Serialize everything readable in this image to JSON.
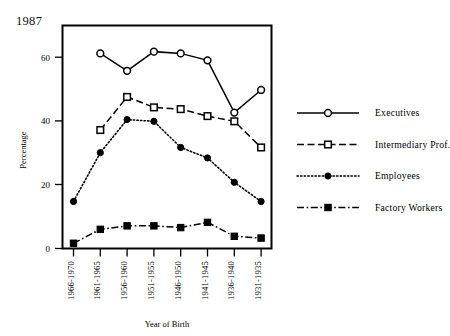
{
  "chart_data": {
    "type": "line",
    "title": "1987",
    "xlabel": "Year of Birth",
    "ylabel": "Percentage",
    "categories": [
      "1966-1970",
      "1961-1965",
      "1956-1960",
      "1951-1955",
      "1946-1950",
      "1941-1945",
      "1936-1940",
      "1931-1935"
    ],
    "ylim": [
      0,
      64
    ],
    "yticks": [
      0,
      20,
      40,
      60
    ],
    "ytick_labels": [
      "0",
      "20",
      "40",
      "60"
    ],
    "grid": false,
    "legend_position": "right",
    "series": [
      {
        "name": "Executives",
        "values": [
          null,
          56,
          51,
          56.5,
          56,
          54,
          39,
          45.5
        ],
        "line_style": "solid",
        "marker": "open-circle",
        "color": "#000000"
      },
      {
        "name": "Intermediary Prof.",
        "values": [
          null,
          34,
          43.5,
          40.5,
          40,
          38,
          36.5,
          29
        ],
        "line_style": "dashed",
        "marker": "open-square",
        "color": "#000000"
      },
      {
        "name": "Employees",
        "values": [
          13.5,
          27.5,
          37,
          36.5,
          29,
          26,
          19,
          13.5
        ],
        "line_style": "dotted",
        "marker": "filled-diamond",
        "color": "#000000"
      },
      {
        "name": "Factory Workers",
        "values": [
          1.5,
          5.5,
          6.5,
          6.5,
          6,
          7.5,
          3.5,
          3
        ],
        "line_style": "dash-dot",
        "marker": "filled-square",
        "color": "#000000"
      }
    ]
  },
  "legend": {
    "entries": [
      {
        "label": "Executives"
      },
      {
        "label": "Intermediary Prof."
      },
      {
        "label": "Employees"
      },
      {
        "label": "Factory Workers"
      }
    ]
  }
}
